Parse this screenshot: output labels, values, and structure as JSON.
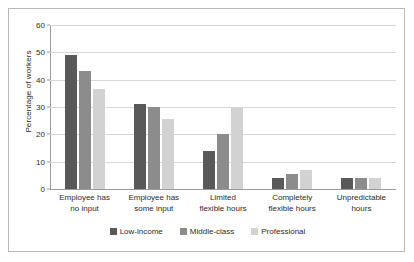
{
  "chart_data": {
    "type": "bar",
    "title": "",
    "xlabel": "",
    "ylabel": "Percentage of workers",
    "ylim": [
      0,
      60
    ],
    "yticks": [
      0,
      10,
      20,
      30,
      40,
      50,
      60
    ],
    "grid": true,
    "legend_position": "bottom",
    "categories": [
      "Employee has\nno input",
      "Employee has\nsome input",
      "Limited\nflexible hours",
      "Completely\nflexible hours",
      "Unpredictable\nhours"
    ],
    "category_lines": [
      [
        "Employee has",
        "no input"
      ],
      [
        "Employee has",
        "some input"
      ],
      [
        "Limited",
        "flexible hours"
      ],
      [
        "Completely",
        "flexible hours"
      ],
      [
        "Unpredictable",
        "hours"
      ]
    ],
    "series": [
      {
        "name": "Low-income",
        "color": "#595959",
        "values": [
          49,
          31,
          14,
          4,
          4
        ]
      },
      {
        "name": "Middle-class",
        "color": "#8c8c8c",
        "values": [
          43,
          30,
          20,
          5.5,
          4
        ]
      },
      {
        "name": "Professional",
        "color": "#d2d2d2",
        "values": [
          36.5,
          25.5,
          29.5,
          7,
          4
        ]
      }
    ]
  },
  "colors": {
    "axis": "#9a9a9a",
    "grid": "#d7d7d7",
    "text": "#2b2b2b",
    "frame": "#b9b9b9",
    "background": "#ffffff"
  }
}
